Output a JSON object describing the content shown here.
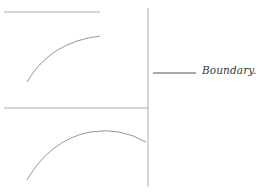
{
  "diagram": {
    "colors": {
      "background": "#ffffff",
      "line": "#9a9a9a",
      "curve": "#8a8a8a",
      "legend_line": "#555555",
      "text": "#3a3a3a"
    },
    "legend": {
      "label": "Boundary."
    },
    "panels": [
      {
        "name": "upper-panel",
        "elements": [
          "top-horizontal-line",
          "upper-arc"
        ]
      },
      {
        "name": "lower-panel",
        "elements": [
          "middle-horizontal-line",
          "lower-arc"
        ]
      }
    ]
  }
}
